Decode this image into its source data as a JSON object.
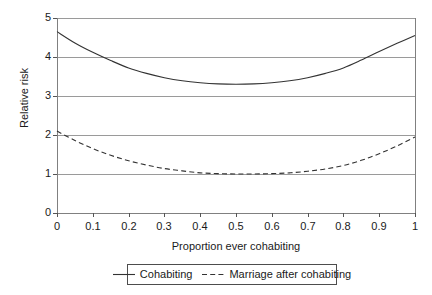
{
  "chart_data": {
    "type": "line",
    "title": "",
    "xlabel": "Proportion ever cohabiting",
    "ylabel": "Relative risk",
    "xlim": [
      0,
      1
    ],
    "ylim": [
      0,
      5
    ],
    "grid": true,
    "grid_axis": "y",
    "legend_position": "bottom",
    "xticks": [
      "0",
      "0.1",
      "0.2",
      "0.3",
      "0.4",
      "0.5",
      "0.6",
      "0.7",
      "0.8",
      "0.9",
      "1"
    ],
    "xtick_values": [
      0,
      0.1,
      0.2,
      0.3,
      0.4,
      0.5,
      0.6,
      0.7,
      0.8,
      0.9,
      1
    ],
    "yticks": [
      "0",
      "1",
      "2",
      "3",
      "4",
      "5"
    ],
    "ytick_values": [
      0,
      1,
      2,
      3,
      4,
      5
    ],
    "x": [
      0,
      0.05,
      0.1,
      0.15,
      0.2,
      0.25,
      0.3,
      0.35,
      0.4,
      0.45,
      0.5,
      0.55,
      0.6,
      0.65,
      0.7,
      0.75,
      0.8,
      0.85,
      0.9,
      0.95,
      1
    ],
    "series": [
      {
        "name": "Cohabiting",
        "style": "solid",
        "color": "#333333",
        "values": [
          4.65,
          4.36,
          4.12,
          3.91,
          3.72,
          3.58,
          3.47,
          3.39,
          3.34,
          3.31,
          3.3,
          3.31,
          3.34,
          3.39,
          3.47,
          3.58,
          3.72,
          3.92,
          4.14,
          4.35,
          4.55
        ]
      },
      {
        "name": "Marriage after cohabiting",
        "style": "dashed",
        "color": "#333333",
        "values": [
          2.1,
          1.86,
          1.65,
          1.48,
          1.34,
          1.23,
          1.14,
          1.08,
          1.03,
          1.01,
          1.0,
          1.0,
          1.01,
          1.03,
          1.07,
          1.13,
          1.22,
          1.35,
          1.52,
          1.72,
          1.95
        ]
      }
    ]
  },
  "legend": {
    "entries": [
      {
        "label": "Cohabiting",
        "style": "solid"
      },
      {
        "label": "Marriage after cohabiting",
        "style": "dashed"
      }
    ]
  },
  "colors": {
    "curve": "#333333",
    "gridline": "#9a9a9a",
    "axis": "#808080",
    "text": "#1a1a1a",
    "background": "#ffffff",
    "legend_border": "#4d4d4d"
  }
}
